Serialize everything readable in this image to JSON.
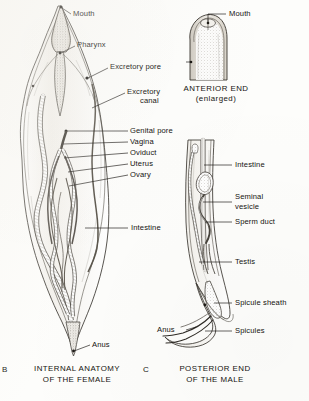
{
  "plate": {
    "subject": "Nematode (roundworm) internal anatomy plate",
    "background_color": "#fdfdfb",
    "ink_color": "#15130f"
  },
  "panels": [
    {
      "id": "female",
      "letter": "B",
      "caption_line1": "INTERNAL ANATOMY",
      "caption_line2": "OF THE FEMALE",
      "labels": [
        {
          "name": "mouth",
          "text": "Mouth"
        },
        {
          "name": "pharynx",
          "text": "Pharynx"
        },
        {
          "name": "excretory-pore",
          "text": "Excretory pore"
        },
        {
          "name": "excretory-canal",
          "text": "Excretory"
        },
        {
          "name": "excretory-canal2",
          "text": "canal"
        },
        {
          "name": "genital-pore",
          "text": "Genital pore"
        },
        {
          "name": "vagina",
          "text": "Vagina"
        },
        {
          "name": "oviduct",
          "text": "Oviduct"
        },
        {
          "name": "uterus",
          "text": "Uterus"
        },
        {
          "name": "ovary",
          "text": "Ovary"
        },
        {
          "name": "intestine",
          "text": "Intestine"
        },
        {
          "name": "anus",
          "text": "Anus"
        }
      ]
    },
    {
      "id": "anterior",
      "letter": "",
      "caption_line1": "ANTERIOR END",
      "caption_line2": "(enlarged)",
      "labels": [
        {
          "name": "mouth",
          "text": "Mouth"
        }
      ]
    },
    {
      "id": "male",
      "letter": "C",
      "caption_line1": "POSTERIOR END",
      "caption_line2": "OF THE MALE",
      "labels": [
        {
          "name": "intestine",
          "text": "Intestine"
        },
        {
          "name": "seminal-vesicle",
          "text": "Seminal"
        },
        {
          "name": "seminal-vesicle2",
          "text": "vesicle"
        },
        {
          "name": "sperm-duct",
          "text": "Sperm duct"
        },
        {
          "name": "testis",
          "text": "Testis"
        },
        {
          "name": "spicule-sheath",
          "text": "Spicule sheath"
        },
        {
          "name": "spicules",
          "text": "Spicules"
        },
        {
          "name": "anus",
          "text": "Anus"
        }
      ]
    }
  ]
}
